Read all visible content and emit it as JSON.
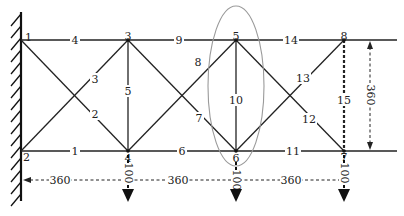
{
  "diagram": {
    "colors": {
      "line": "#222222",
      "ellipse": "#9a9a9a",
      "background": "#ffffff"
    },
    "nodes": [
      {
        "id": "1",
        "label": "1",
        "x": 21,
        "y": 40
      },
      {
        "id": "2",
        "label": "2",
        "x": 21,
        "y": 151
      },
      {
        "id": "3",
        "label": "3",
        "x": 128,
        "y": 40
      },
      {
        "id": "4",
        "label": "4",
        "x": 128,
        "y": 151
      },
      {
        "id": "5",
        "label": "5",
        "x": 236,
        "y": 40
      },
      {
        "id": "6",
        "label": "6",
        "x": 236,
        "y": 151
      },
      {
        "id": "7",
        "label": "7",
        "x": 344,
        "y": 151
      },
      {
        "id": "8",
        "label": "8",
        "x": 344,
        "y": 40
      }
    ],
    "members": [
      {
        "id": "1",
        "label": "1",
        "from": "2",
        "to": "4"
      },
      {
        "id": "2",
        "label": "2",
        "from": "1",
        "to": "4"
      },
      {
        "id": "3",
        "label": "3",
        "from": "2",
        "to": "3"
      },
      {
        "id": "4",
        "label": "4",
        "from": "1",
        "to": "3"
      },
      {
        "id": "5",
        "label": "5",
        "from": "3",
        "to": "4"
      },
      {
        "id": "6",
        "label": "6",
        "from": "4",
        "to": "6"
      },
      {
        "id": "7",
        "label": "7",
        "from": "3",
        "to": "6"
      },
      {
        "id": "8",
        "label": "8",
        "from": "4",
        "to": "5"
      },
      {
        "id": "9",
        "label": "9",
        "from": "3",
        "to": "5"
      },
      {
        "id": "10",
        "label": "10",
        "from": "5",
        "to": "6"
      },
      {
        "id": "11",
        "label": "11",
        "from": "6",
        "to": "7"
      },
      {
        "id": "12",
        "label": "12",
        "from": "5",
        "to": "7"
      },
      {
        "id": "13",
        "label": "13",
        "from": "6",
        "to": "8"
      },
      {
        "id": "14",
        "label": "14",
        "from": "5",
        "to": "8"
      },
      {
        "id": "15",
        "label": "15",
        "from": "8",
        "to": "7",
        "style": "dashed"
      }
    ],
    "dimensions": {
      "horizontal": [
        {
          "label": "360",
          "from_x": 21,
          "to_x": 128
        },
        {
          "label": "360",
          "from_x": 128,
          "to_x": 236
        },
        {
          "label": "360",
          "from_x": 236,
          "to_x": 344
        }
      ],
      "vertical": {
        "label": "360",
        "from_y": 40,
        "to_y": 151
      }
    },
    "loads": [
      {
        "node": "4",
        "label": "100",
        "direction": "down"
      },
      {
        "node": "6",
        "label": "100",
        "direction": "down"
      },
      {
        "node": "7",
        "label": "100",
        "direction": "down"
      }
    ],
    "highlight": {
      "shape": "ellipse",
      "around_member": "10"
    },
    "support": {
      "type": "fixed-wall",
      "nodes": [
        "1",
        "2"
      ]
    }
  }
}
